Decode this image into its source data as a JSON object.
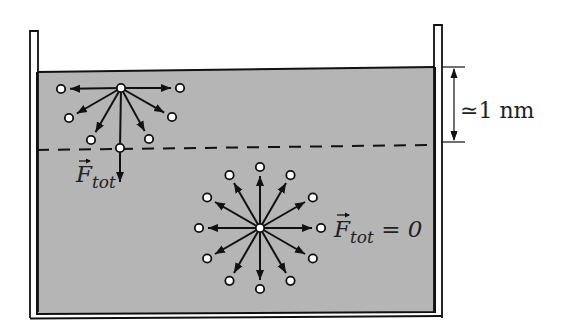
{
  "figure": {
    "colors": {
      "liquid_fill": "#b5b5b5",
      "line": "#111111",
      "molecule_fill": "#ffffff",
      "background": "#ffffff"
    },
    "container": {
      "left_wall_top_y": 31,
      "right_wall_top_y": 25,
      "surface_left": [
        37,
        72
      ],
      "surface_right": [
        435,
        67
      ],
      "bottom_y": 314
    },
    "surface_layer": {
      "dashed_line_left": [
        37,
        150
      ],
      "dashed_line_right": [
        433,
        145
      ],
      "thickness_label": "≃1 nm"
    },
    "surface_molecule": {
      "center": [
        121,
        88
      ],
      "neighbors": [
        [
          61,
          89
        ],
        [
          180,
          88
        ],
        [
          69,
          118
        ],
        [
          172,
          117
        ],
        [
          91,
          140
        ],
        [
          149,
          139
        ]
      ],
      "net_force_tip": [
        120,
        182
      ],
      "force_label_main": "F",
      "force_label_sub": "tot"
    },
    "bulk_molecule": {
      "center": [
        260,
        228
      ],
      "radius": 61,
      "neighbor_count": 12,
      "force_label_main": "F",
      "force_label_sub": "tot",
      "force_label_rest": " = 0"
    }
  }
}
